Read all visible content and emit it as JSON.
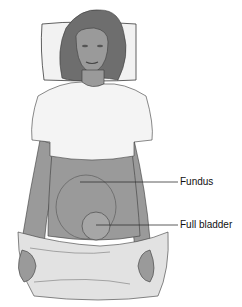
{
  "figure": {
    "colors": {
      "skin": "#9a9a9a",
      "hair": "#6e6e6e",
      "shirt": "#f4f4f4",
      "sheet": "#e2e2e2",
      "outline": "#3a3a3a",
      "pillow": "#f2f2f2"
    }
  },
  "labels": [
    {
      "id": "fundus",
      "text": "Fundus"
    },
    {
      "id": "bladder",
      "text": "Full bladder"
    }
  ]
}
